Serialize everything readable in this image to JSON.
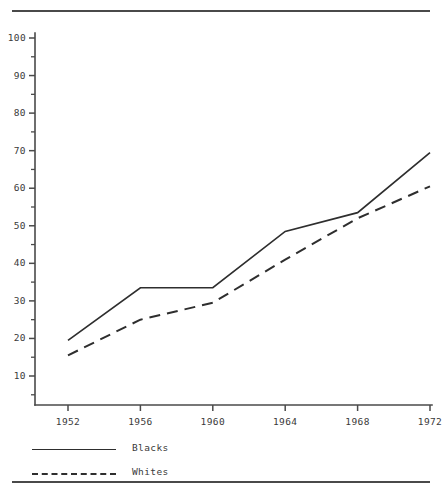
{
  "chart_data": {
    "type": "line",
    "title": "",
    "subtitle": "",
    "xlabel": "",
    "ylabel": "",
    "categories": [
      "1952",
      "1956",
      "1960",
      "1964",
      "1968",
      "1972"
    ],
    "x": [
      1952,
      1956,
      1960,
      1964,
      1968,
      1972
    ],
    "xlim": [
      1950,
      1972
    ],
    "ylim": [
      1.5,
      101
    ],
    "grid": false,
    "legend_position": "below-axes",
    "y_tick_labels": [
      "10",
      "20",
      "30",
      "40",
      "50",
      "60",
      "70",
      "80",
      "90",
      "100"
    ],
    "y_ticks": [
      10,
      20,
      30,
      40,
      50,
      60,
      70,
      80,
      90,
      100
    ],
    "y_minor_ticks": [
      5,
      15,
      25,
      35,
      45,
      55,
      65,
      75,
      85,
      95
    ],
    "x_tick_labels": [
      "1952",
      "1956",
      "1960",
      "1964",
      "1968",
      "1972"
    ],
    "series": [
      {
        "name": "Blacks",
        "style": "solid",
        "values": [
          19.5,
          33.5,
          33.5,
          48.5,
          53.5,
          69.5
        ]
      },
      {
        "name": "Whites",
        "style": "dashed",
        "values": [
          15.5,
          25.0,
          29.5,
          41.0,
          52.0,
          60.5
        ]
      }
    ]
  },
  "legend": {
    "items": [
      {
        "label": "Blacks",
        "style": "solid"
      },
      {
        "label": "Whites",
        "style": "dashed"
      }
    ]
  },
  "colors": {
    "line": "#2e2e2e",
    "axis": "#4a4a4a",
    "text": "#3a3a3a",
    "background": "#ffffff"
  }
}
